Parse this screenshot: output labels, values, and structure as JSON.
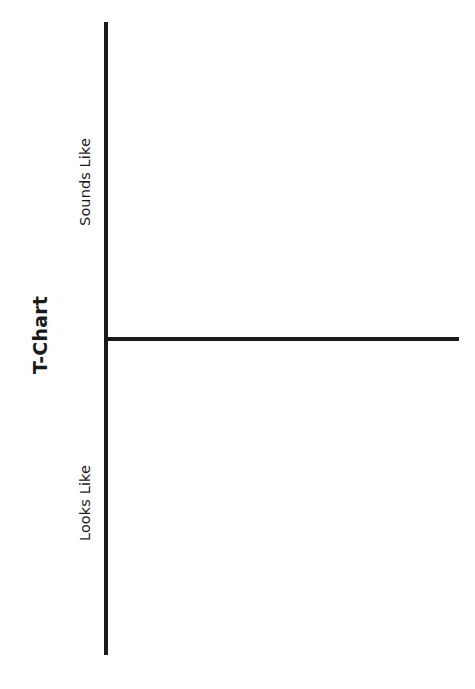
{
  "page": {
    "background_color": "#ffffff",
    "ink_color": "#1a1a1a",
    "width": 475,
    "height": 689
  },
  "chart_data": {
    "type": "table",
    "title": "T-Chart",
    "orientation": "rotated-90-ccw",
    "categories": [
      "Sounds Like",
      "Looks Like"
    ],
    "values": [
      0,
      0
    ],
    "series": [
      {
        "name": "Sounds Like",
        "entries": []
      },
      {
        "name": "Looks Like",
        "entries": []
      }
    ],
    "xlabel": "",
    "ylabel": "",
    "grid": false,
    "legend": "none",
    "note": "Blank two-column T-chart worksheet; both sections are empty."
  },
  "title": {
    "text": "T-Chart"
  },
  "sections": [
    {
      "label": "Sounds Like",
      "content": ""
    },
    {
      "label": "Looks Like",
      "content": ""
    }
  ],
  "rules": {
    "vertical_name": "t-chart-vertical-rule",
    "horizontal_name": "t-chart-horizontal-rule"
  }
}
